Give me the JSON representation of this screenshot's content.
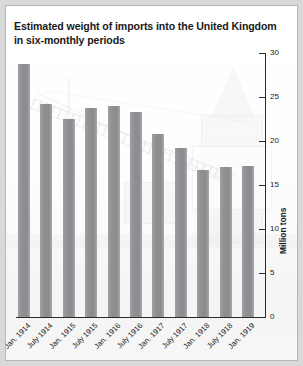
{
  "chart_data": {
    "type": "bar",
    "title": "Estimated weight of imports into the United Kingdom in six-monthly periods",
    "title_line1": "Estimated weight of imports into the United Kingdom",
    "title_line2": "in six-monthly periods",
    "xlabel": "",
    "ylabel": "Million tons",
    "ylim": [
      0,
      30
    ],
    "yticks": [
      0,
      5,
      10,
      15,
      20,
      25,
      30
    ],
    "ytick_labels": [
      "0",
      "5",
      "10",
      "15",
      "20",
      "25",
      "30"
    ],
    "grid": false,
    "legend": "none",
    "axis_position": "right",
    "categories": [
      "Jan. 1914",
      "July 1914",
      "Jan. 1915",
      "July 1915",
      "Jan. 1916",
      "July 1916",
      "Jan. 1917",
      "July 1917",
      "Jan. 1918",
      "July 1918",
      "Jan. 1919"
    ],
    "values": [
      28.8,
      24.2,
      22.5,
      23.8,
      24.0,
      23.3,
      20.8,
      19.2,
      16.7,
      17.0,
      17.2
    ],
    "bar_color": "#8e9093",
    "axis_color": "#2a2a2a",
    "background_image": "dockyard-crane-photo"
  }
}
